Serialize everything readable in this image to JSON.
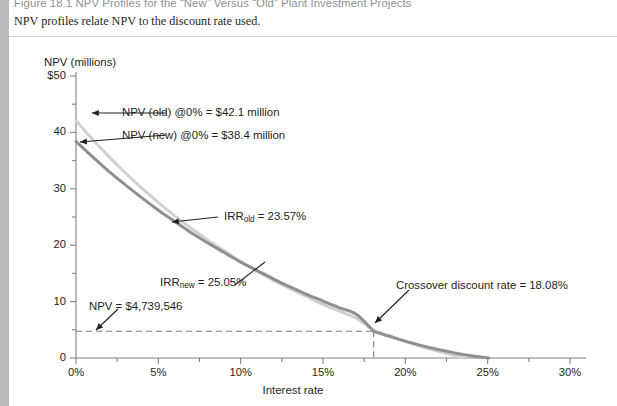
{
  "figure": {
    "title": "Figure 18.1 NPV Profiles for the “New” Versus “Old” Plant Investment Projects",
    "subtitle": "NPV profiles relate NPV to the discount rate used."
  },
  "chart_data": {
    "type": "line",
    "title": "",
    "xlabel": "Interest rate",
    "ylabel": "NPV (millions)",
    "xlim": [
      0,
      30
    ],
    "ylim": [
      0,
      50
    ],
    "grid": false,
    "legend_position": "none",
    "x_ticks": [
      "0%",
      "5%",
      "10%",
      "15%",
      "20%",
      "25%",
      "30%"
    ],
    "x_tick_values": [
      0,
      5,
      10,
      15,
      20,
      25,
      30
    ],
    "x_minor_step": 2.5,
    "y_ticks": [
      "0",
      "10",
      "20",
      "30",
      "40",
      "$50"
    ],
    "y_tick_values": [
      0,
      10,
      20,
      30,
      40,
      50
    ],
    "y_minor_step": 5,
    "series": [
      {
        "name": "NPV (old)",
        "color": "#cfd1d2",
        "npv_at_zero": 42.1,
        "irr": 23.57,
        "x": [
          0,
          1,
          2,
          3,
          4,
          5,
          6,
          7,
          8,
          9,
          10,
          11,
          12,
          13,
          14,
          15,
          16,
          17,
          18,
          18.08,
          19,
          20,
          21,
          22,
          23,
          23.57
        ],
        "values": [
          42.1,
          38.8,
          35.7,
          32.8,
          30.1,
          27.6,
          25.2,
          23.0,
          20.9,
          19.0,
          17.1,
          15.4,
          13.8,
          12.3,
          10.9,
          9.5,
          8.3,
          7.1,
          5.0,
          4.74,
          3.9,
          2.9,
          2.0,
          1.2,
          0.4,
          0.0
        ]
      },
      {
        "name": "NPV (new)",
        "color": "#8d9092",
        "npv_at_zero": 38.4,
        "irr": 25.05,
        "x": [
          0,
          1,
          2,
          3,
          4,
          5,
          6,
          7,
          8,
          9,
          10,
          11,
          12,
          13,
          14,
          15,
          16,
          17,
          18,
          18.08,
          19,
          20,
          21,
          22,
          23,
          24,
          25.05
        ],
        "values": [
          38.4,
          35.7,
          33.1,
          30.7,
          28.4,
          26.2,
          24.2,
          22.2,
          20.4,
          18.7,
          17.0,
          15.5,
          14.0,
          12.6,
          11.3,
          10.1,
          8.9,
          7.8,
          5.0,
          4.74,
          3.9,
          3.0,
          2.2,
          1.5,
          0.9,
          0.4,
          0.0
        ]
      }
    ],
    "crossover": {
      "x": 18.08,
      "y": 4.739546
    },
    "annotations": [
      {
        "name": "npv-old-at-zero",
        "text": "NPV (old) @0% = $42.1 million"
      },
      {
        "name": "npv-new-at-zero",
        "text": "NPV (new) @0% = $38.4 million"
      },
      {
        "name": "irr-old",
        "text": "IRR",
        "sub": "old",
        "tail": " = 23.57%"
      },
      {
        "name": "irr-new",
        "text": "IRR",
        "sub": "new",
        "tail": " = 25.05%"
      },
      {
        "name": "crossover-rate",
        "text": "Crossover discount rate = 18.08%"
      },
      {
        "name": "npv-crossover-value",
        "text": "NPV = $4,739,546"
      }
    ]
  },
  "colors": {
    "old_curve": "#cfd1d2",
    "new_curve": "#8d9092",
    "axis": "#808284",
    "dashed": "#77797b",
    "header_bar": "#b9bbbd",
    "text": "#231f20"
  }
}
